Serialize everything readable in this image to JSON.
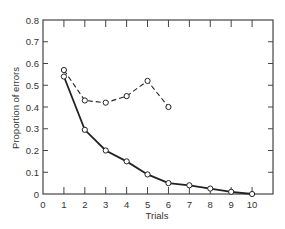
{
  "chart_data": {
    "type": "line",
    "title": "",
    "xlabel": "Trials",
    "ylabel": "Proportion of errors",
    "xlim": [
      0,
      11
    ],
    "ylim": [
      0,
      0.8
    ],
    "x_ticks": [
      0,
      1,
      2,
      3,
      4,
      5,
      6,
      7,
      8,
      9,
      10
    ],
    "y_ticks": [
      0,
      0.1,
      0.2,
      0.3,
      0.4,
      0.5,
      0.6,
      0.7,
      0.8
    ],
    "y_tick_labels": [
      "0",
      "0.1",
      "0.2",
      "0.3",
      "0.4",
      "0.5",
      "0.6",
      "0.7",
      "0.8"
    ],
    "grid": false,
    "legend": null,
    "series": [
      {
        "name": "solid",
        "style": "solid",
        "marker": "open-circle",
        "color": "#222222",
        "x": [
          1,
          2,
          3,
          4,
          5,
          6,
          7,
          8,
          9,
          10
        ],
        "values": [
          0.54,
          0.295,
          0.2,
          0.15,
          0.09,
          0.05,
          0.04,
          0.025,
          0.01,
          0.0
        ]
      },
      {
        "name": "dashed",
        "style": "dashed",
        "marker": "open-circle",
        "color": "#222222",
        "x": [
          1,
          2,
          3,
          4,
          5,
          6
        ],
        "values": [
          0.57,
          0.43,
          0.42,
          0.45,
          0.52,
          0.4
        ]
      }
    ]
  },
  "colors": {
    "axis": "#444444",
    "line": "#222222",
    "background": "#ffffff"
  }
}
